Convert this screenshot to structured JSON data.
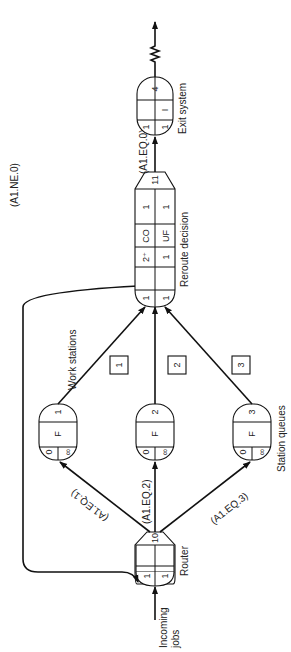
{
  "diagram": {
    "type": "network-flow-diagram",
    "orientation": "rotated-90-ccw",
    "nodes": {
      "router": {
        "label": "Router",
        "top": "10",
        "cells": [
          "1",
          "1"
        ]
      },
      "station_queues": {
        "label": "Station queues",
        "queues": [
          {
            "id": "1",
            "number": "1",
            "discipline": "F",
            "initial": "0",
            "capacity": "∞"
          },
          {
            "id": "2",
            "number": "2",
            "discipline": "F",
            "initial": "0",
            "capacity": "∞"
          },
          {
            "id": "3",
            "number": "3",
            "discipline": "F",
            "initial": "0",
            "capacity": "∞"
          }
        ]
      },
      "work_stations": {
        "label": "Work stations",
        "boxes": [
          "1",
          "2",
          "3"
        ]
      },
      "reroute": {
        "label": "Reroute decision",
        "top": "11",
        "row1": [
          "1",
          "",
          "2⁺",
          "CO",
          "1"
        ],
        "row2": [
          "1",
          "",
          "1",
          "UF",
          "1"
        ]
      },
      "exit": {
        "label": "Exit system",
        "top": "4",
        "row1": [
          "1",
          ""
        ],
        "row2": [
          "1",
          "I"
        ]
      }
    },
    "incoming": {
      "label_line1": "Incoming",
      "label_line2": "jobs"
    },
    "edges": {
      "q1": "(A1.EQ.1)",
      "q2": "(A1.EQ.2)",
      "q3": "(A1.EQ.3)",
      "loop": "(A1.NE.0)",
      "exit": "(A1.EQ.0)"
    }
  }
}
